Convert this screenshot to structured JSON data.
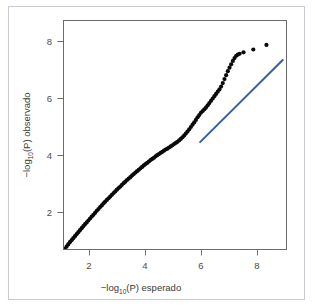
{
  "figure": {
    "background_color": "#ffffff",
    "frame_color": "#c9c9d8",
    "plot_box_color": "#6b6b6b"
  },
  "axes": {
    "x_title_main": "−log",
    "x_title_sub": "10",
    "x_title_rest": "(P) esperado",
    "y_title_main": "−log",
    "y_title_sub": "10",
    "y_title_rest": "(P) observado",
    "x_ticks": [
      "2",
      "4",
      "6",
      "8"
    ],
    "y_ticks": [
      "2",
      "4",
      "6",
      "8"
    ]
  },
  "chart_data": {
    "type": "scatter",
    "title": "",
    "subtitle": "",
    "xlabel": "−log10(P) esperado",
    "ylabel": "−log10(P) observado",
    "xlim": [
      1.0,
      8.9
    ],
    "ylim": [
      0.6,
      8.6
    ],
    "xticks": [
      2,
      4,
      6,
      8
    ],
    "yticks": [
      2,
      4,
      6,
      8
    ],
    "grid": false,
    "legend": null,
    "point_color": "#0a0a0a",
    "point_radius": 2.1,
    "series": [
      {
        "name": "observed quantiles",
        "marker": "filled-circle",
        "x": [
          1.12,
          1.18,
          1.24,
          1.3,
          1.36,
          1.42,
          1.48,
          1.54,
          1.6,
          1.66,
          1.72,
          1.78,
          1.84,
          1.9,
          1.96,
          2.02,
          2.08,
          2.14,
          2.2,
          2.26,
          2.32,
          2.38,
          2.44,
          2.5,
          2.56,
          2.62,
          2.68,
          2.74,
          2.8,
          2.86,
          2.92,
          2.98,
          3.04,
          3.1,
          3.16,
          3.22,
          3.28,
          3.34,
          3.4,
          3.46,
          3.52,
          3.58,
          3.64,
          3.7,
          3.76,
          3.82,
          3.88,
          3.94,
          4.0,
          4.06,
          4.12,
          4.18,
          4.24,
          4.3,
          4.36,
          4.42,
          4.48,
          4.54,
          4.6,
          4.66,
          4.72,
          4.78,
          4.84,
          4.9,
          4.96,
          5.02,
          5.08,
          5.14,
          5.2,
          5.26,
          5.32,
          5.38,
          5.44,
          5.5,
          5.56,
          5.62,
          5.68,
          5.74,
          5.8,
          5.86,
          5.92,
          5.98,
          6.04,
          6.1,
          6.16,
          6.22,
          6.28,
          6.34,
          6.4,
          6.46,
          6.52,
          6.58,
          6.64,
          6.7,
          6.76,
          6.82,
          6.88,
          6.94,
          7.0,
          7.06,
          7.12,
          7.18,
          7.24,
          7.3,
          7.36,
          7.5,
          7.85,
          8.32
        ],
        "y": [
          0.72,
          0.8,
          0.88,
          0.96,
          1.03,
          1.1,
          1.17,
          1.24,
          1.31,
          1.38,
          1.45,
          1.52,
          1.59,
          1.65,
          1.72,
          1.79,
          1.86,
          1.92,
          1.99,
          2.06,
          2.12,
          2.19,
          2.25,
          2.32,
          2.38,
          2.44,
          2.5,
          2.56,
          2.62,
          2.68,
          2.74,
          2.8,
          2.86,
          2.91,
          2.97,
          3.03,
          3.08,
          3.14,
          3.19,
          3.24,
          3.3,
          3.35,
          3.4,
          3.45,
          3.5,
          3.55,
          3.6,
          3.65,
          3.7,
          3.74,
          3.79,
          3.84,
          3.88,
          3.92,
          3.97,
          4.01,
          4.05,
          4.09,
          4.13,
          4.17,
          4.21,
          4.24,
          4.28,
          4.32,
          4.36,
          4.4,
          4.44,
          4.48,
          4.53,
          4.58,
          4.64,
          4.7,
          4.77,
          4.84,
          4.92,
          5.0,
          5.08,
          5.16,
          5.25,
          5.34,
          5.42,
          5.5,
          5.56,
          5.62,
          5.68,
          5.76,
          5.84,
          5.92,
          6.0,
          6.08,
          6.16,
          6.24,
          6.32,
          6.42,
          6.54,
          6.68,
          6.82,
          6.96,
          7.08,
          7.2,
          7.32,
          7.42,
          7.5,
          7.54,
          7.57,
          7.62,
          7.72,
          7.88
        ]
      }
    ],
    "reference_line": {
      "name": "identity / null expectation line",
      "color": "#36609f",
      "width": 2.0,
      "x0": 5.95,
      "y0": 4.47,
      "x1": 8.9,
      "y1": 7.35
    }
  }
}
